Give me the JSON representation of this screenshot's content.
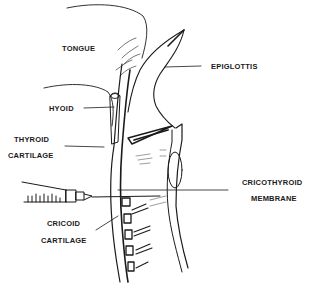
{
  "diagram": {
    "type": "anatomical-line-illustration",
    "labels": {
      "tongue": "TONGUE",
      "epiglottis": "EPIGLOTTIS",
      "hyoid": "HYOID",
      "thyroid_line1": "THYROID",
      "thyroid_line2": "CARTILAGE",
      "cricothyroid_line1": "CRICOTHYROID",
      "cricothyroid_line2": "MEMBRANE",
      "cricoid_line1": "CRICOID",
      "cricoid_line2": "CARTILAGE"
    },
    "colors": {
      "ink": "#1a1a1a",
      "background": "#ffffff"
    }
  }
}
